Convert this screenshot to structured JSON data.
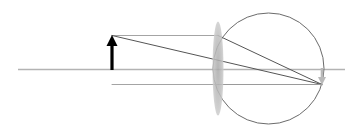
{
  "figure": {
    "type": "optics-ray-diagram",
    "canvas": {
      "width": 360,
      "height": 137,
      "background": "#ffffff"
    }
  },
  "colors": {
    "optical_axis": "#b3b3b3",
    "ray": "#555555",
    "construction_ray": "#9a9a9a",
    "circle_outline": "#6b6b6b",
    "lens_fill": "#bcbcbc",
    "object_arrow": "#000000",
    "image_arrow": "#b9b9b9"
  },
  "optical_axis": {
    "label": "optical-axis",
    "y": 69.5,
    "x_start": 18,
    "x_end": 345,
    "stroke_width": 1.6
  },
  "eyeball_circle": {
    "label": "eye-sphere",
    "center_x": 268.5,
    "center_y": 68.5,
    "radius": 55.5,
    "stroke_width": 1.0
  },
  "lens": {
    "label": "converging-lens",
    "center_x": 218,
    "center_y": 68.5,
    "half_width": 5.5,
    "half_height": 47
  },
  "object_arrow": {
    "label": "object-arrow",
    "x": 112,
    "base_y": 70,
    "tip_y": 35,
    "shaft_width": 3.2,
    "head_width": 11,
    "head_height": 11
  },
  "image_arrow": {
    "label": "image-arrow-inverted",
    "x": 322,
    "base_y": 68,
    "tip_y": 85,
    "shaft_width": 2.6,
    "head_width": 8,
    "head_height": 8
  },
  "rays": [
    {
      "name": "parallel-ray-incident",
      "description": "Ray from object tip travelling parallel to the optical axis toward the lens",
      "points": [
        [
          112,
          35.5
        ],
        [
          218,
          35.5
        ]
      ],
      "weight": 0.9,
      "tone": "construction"
    },
    {
      "name": "parallel-ray-refracted",
      "description": "Refracted ray from lens through the focal point to the image tip",
      "points": [
        [
          218,
          35.5
        ],
        [
          322,
          84.5
        ]
      ],
      "weight": 1.0,
      "tone": "ray"
    },
    {
      "name": "chief-ray",
      "description": "Ray from object tip straight through the lens centre to the image tip",
      "points": [
        [
          112,
          35.5
        ],
        [
          322,
          84.5
        ]
      ],
      "weight": 1.0,
      "tone": "ray"
    },
    {
      "name": "base-ray-incident",
      "description": "Ray from object base running along to the lower lens edge",
      "points": [
        [
          112,
          84.5
        ],
        [
          218,
          84.5
        ]
      ],
      "weight": 0.9,
      "tone": "construction"
    },
    {
      "name": "base-ray-refracted",
      "description": "Continuation along the image plane to the image arrow base",
      "points": [
        [
          218,
          84.5
        ],
        [
          322,
          84.5
        ]
      ],
      "weight": 1.0,
      "tone": "construction"
    }
  ]
}
